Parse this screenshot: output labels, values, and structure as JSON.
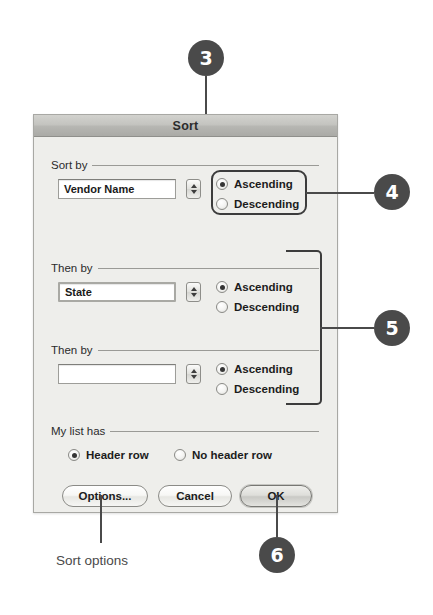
{
  "dialog": {
    "title": "Sort",
    "groups": {
      "sort_by_label": "Sort by",
      "then_by_1_label": "Then by",
      "then_by_2_label": "Then by",
      "my_list_has_label": "My list has"
    },
    "rows": [
      {
        "field_value": "Vendor Name",
        "field_placeholder": "",
        "ascending_label": "Ascending",
        "descending_label": "Descending",
        "selected": "Ascending"
      },
      {
        "field_value": "State",
        "field_placeholder": "",
        "ascending_label": "Ascending",
        "descending_label": "Descending",
        "selected": "Ascending"
      },
      {
        "field_value": "",
        "field_placeholder": "",
        "ascending_label": "Ascending",
        "descending_label": "Descending",
        "selected": "Ascending"
      }
    ],
    "list_has": {
      "header_row_label": "Header row",
      "no_header_row_label": "No header row",
      "selected": "Header row"
    },
    "buttons": {
      "options_label": "Options...",
      "cancel_label": "Cancel",
      "ok_label": "OK"
    }
  },
  "annotations": {
    "callouts": [
      {
        "number": "3"
      },
      {
        "number": "4"
      },
      {
        "number": "5"
      },
      {
        "number": "6"
      }
    ],
    "caption": "Sort options"
  },
  "colors": {
    "callout_fill": "#4a4a4a",
    "callout_text": "#ffffff",
    "highlight_stroke": "#3c3c3c",
    "dialog_bg": "#eeeeeb",
    "titlebar_bg": "#bcbcb8"
  }
}
